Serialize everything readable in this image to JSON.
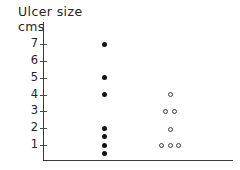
{
  "chart_data": {
    "type": "scatter",
    "title": "Ulcer size",
    "ylabel": "cms",
    "xlabel": "",
    "grid": false,
    "legend": "none",
    "ylim": [
      0,
      7.6
    ],
    "yticks": [
      1,
      2,
      3,
      4,
      5,
      6,
      7
    ],
    "ytick_labels": [
      "1",
      "2",
      "3",
      "4",
      "5",
      "6",
      "7"
    ],
    "xlim": [
      0,
      3
    ],
    "xticks": [],
    "xtick_labels": [],
    "series": [
      {
        "name": "group-1-filled",
        "marker": "filled-circle",
        "color": "#111111",
        "x": [
          1,
          1,
          1,
          1,
          1,
          1,
          1
        ],
        "values": [
          7,
          5,
          4,
          2,
          1.5,
          1,
          0.5
        ],
        "points": [
          {
            "x": 1,
            "y": 7
          },
          {
            "x": 1,
            "y": 5
          },
          {
            "x": 1,
            "y": 4
          },
          {
            "x": 1,
            "y": 2
          },
          {
            "x": 1,
            "y": 1.5
          },
          {
            "x": 1,
            "y": 1
          },
          {
            "x": 1,
            "y": 0.5
          }
        ]
      },
      {
        "name": "group-2-open",
        "marker": "open-circle",
        "color": "#3d3d3d",
        "x": [
          2,
          1.93,
          2.07,
          2,
          1.87,
          2,
          2.13
        ],
        "values": [
          4,
          3,
          3,
          1.9,
          1,
          1,
          1
        ],
        "points": [
          {
            "x": 2.0,
            "y": 4
          },
          {
            "x": 1.93,
            "y": 3
          },
          {
            "x": 2.07,
            "y": 3
          },
          {
            "x": 2.0,
            "y": 1.9
          },
          {
            "x": 1.87,
            "y": 1
          },
          {
            "x": 2.0,
            "y": 1
          },
          {
            "x": 2.13,
            "y": 1
          }
        ]
      }
    ]
  },
  "axes": {
    "y_axis_name": "ulcer-size-axis",
    "x_axis_name": "group-axis"
  }
}
